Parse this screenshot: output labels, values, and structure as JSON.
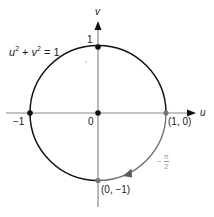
{
  "diagram": {
    "axes": {
      "horizontal_label": "u",
      "vertical_label": "v",
      "color": "#888888"
    },
    "equation": {
      "u": "u",
      "u_exp": "2",
      "plus": " + ",
      "v": "v",
      "v_exp": "2",
      "rhs": " = 1"
    },
    "circle": {
      "main_color": "#111111",
      "highlight_arc_color": "#6a6a6a",
      "highlight_arc": "from (1, 0) clockwise to (0, -1)"
    },
    "points": [
      {
        "id": "top",
        "label": "1",
        "coord": "(0, 1)",
        "color": "#111111"
      },
      {
        "id": "left",
        "label": "-1",
        "coord": "(-1, 0)",
        "color": "#111111"
      },
      {
        "id": "origin",
        "label": "0",
        "coord": "(0, 0)",
        "color": "#111111"
      },
      {
        "id": "right",
        "label": "(1, 0)",
        "coord": "(1, 0)",
        "color": "#777777"
      },
      {
        "id": "bottom",
        "label": "(0, −1)",
        "coord": "(0, -1)",
        "color": "#777777"
      }
    ],
    "angle_label": {
      "sign": "−",
      "numerator": "π",
      "denominator": "2"
    },
    "labels": {
      "top": "1",
      "left": "−1",
      "origin": "0",
      "right": "(1, 0)",
      "bottom": "(0, −1)"
    }
  }
}
